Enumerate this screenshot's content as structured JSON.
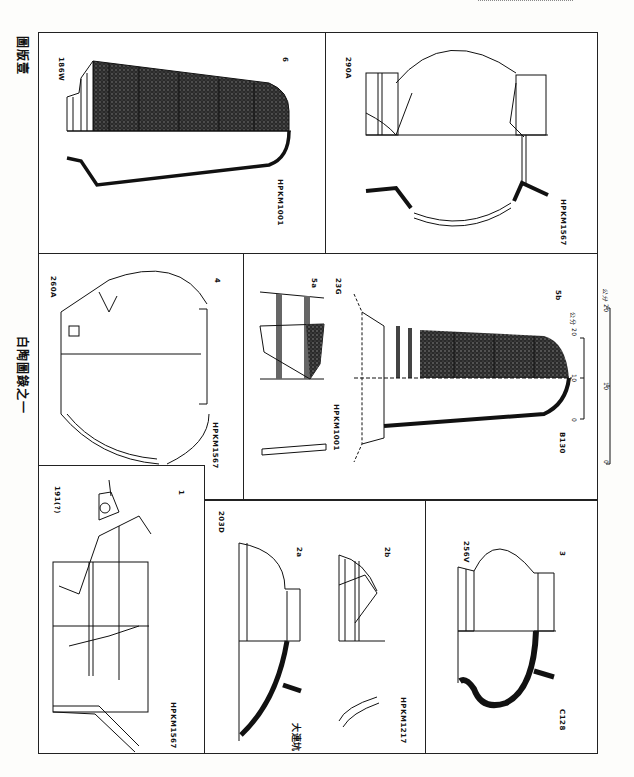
{
  "plate": {
    "plate_title": "圖版壹",
    "series_title": "白陶圖錄之一"
  },
  "panels": [
    {
      "id": "6",
      "number": "6",
      "field_no": "186W",
      "tomb": "HPKM1001"
    },
    {
      "id": "290A",
      "number": "",
      "field_no": "290A",
      "tomb": "HPKM1567"
    },
    {
      "id": "4",
      "number": "4",
      "field_no": "260A",
      "tomb": "HPKM1567"
    },
    {
      "id": "5",
      "number_a": "5a",
      "number_b": "5b",
      "field_no": "23G",
      "tomb": "HPKM1001",
      "catalog": "B130"
    },
    {
      "id": "1",
      "number": "1",
      "field_no": "191(?)",
      "tomb": "HPKM1567"
    },
    {
      "id": "2",
      "number_a": "2a",
      "number_b": "2b",
      "field_no": "203D",
      "site": "大連坑",
      "tomb": "HPKM1217"
    },
    {
      "id": "3",
      "number": "3",
      "field_no": "256V",
      "catalog": "C128"
    }
  ],
  "scales": {
    "inner": {
      "ticks": [
        "0",
        "10",
        "20"
      ],
      "unit": "公分"
    },
    "outer": {
      "ticks": [
        "0",
        "10",
        "20"
      ],
      "unit": "公分"
    }
  }
}
